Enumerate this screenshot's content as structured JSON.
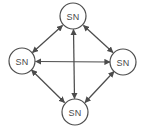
{
  "diagram": {
    "type": "node-link-graph",
    "title": "",
    "background_color": "#ffffff",
    "node_fill": "#ffffff",
    "node_stroke": "#4d4d4d",
    "edge_color": "#4c4c4c",
    "label_color": "#4a4a4a",
    "layout": "diamond",
    "topology": "complete-graph-k4",
    "edge_style": "double-headed-arrow",
    "node_count": 4,
    "edge_count": 6,
    "nodes": [
      {
        "id": "top",
        "label": "SN",
        "cx": 73,
        "cy": 16,
        "r": 13
      },
      {
        "id": "left",
        "label": "SN",
        "cx": 22,
        "cy": 61,
        "r": 13
      },
      {
        "id": "right",
        "label": "SN",
        "cx": 123,
        "cy": 62,
        "r": 13
      },
      {
        "id": "bottom",
        "label": "SN",
        "cx": 75,
        "cy": 112,
        "r": 13
      }
    ],
    "edges": [
      {
        "id": "left-top",
        "from": "left",
        "to": "top",
        "bidirectional": true
      },
      {
        "id": "top-right",
        "from": "top",
        "to": "right",
        "bidirectional": true
      },
      {
        "id": "left-bottom",
        "from": "left",
        "to": "bottom",
        "bidirectional": true
      },
      {
        "id": "bottom-right",
        "from": "bottom",
        "to": "right",
        "bidirectional": true
      },
      {
        "id": "left-right",
        "from": "left",
        "to": "right",
        "bidirectional": true
      },
      {
        "id": "top-bottom",
        "from": "top",
        "to": "bottom",
        "bidirectional": true
      }
    ]
  }
}
